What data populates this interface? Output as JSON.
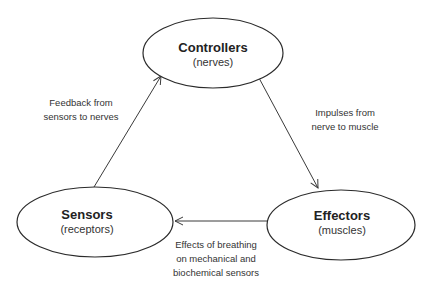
{
  "nodes": {
    "controllers": {
      "title": "Controllers",
      "subtitle": "(nerves)"
    },
    "effectors": {
      "title": "Effectors",
      "subtitle": "(muscles)"
    },
    "sensors": {
      "title": "Sensors",
      "subtitle": "(receptors)"
    }
  },
  "edges": {
    "controllers_to_effectors": {
      "from": "Controllers",
      "to": "Effectors",
      "label_lines": [
        "Impulses from",
        "nerve to muscle"
      ]
    },
    "effectors_to_sensors": {
      "from": "Effectors",
      "to": "Sensors",
      "label_lines": [
        "Effects of breathing",
        "on mechanical and",
        "biochemical sensors"
      ]
    },
    "sensors_to_controllers": {
      "from": "Sensors",
      "to": "Controllers",
      "label_lines": [
        "Feedback from",
        "sensors to nerves"
      ]
    }
  }
}
